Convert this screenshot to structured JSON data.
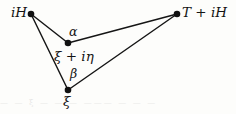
{
  "figure": {
    "name": "contour-triangle-diagram",
    "width": 236,
    "height": 114,
    "background_color": "#fdfdfb",
    "stroke_color": "#151515",
    "vertices": [
      {
        "id": "iH",
        "label": "iH",
        "x": 31,
        "y": 14,
        "label_x": 11,
        "label_y": 6
      },
      {
        "id": "TiH",
        "label": "T + iH",
        "x": 177,
        "y": 14,
        "label_x": 182,
        "label_y": 6
      },
      {
        "id": "xi_ieta",
        "label": "ξ + iη",
        "x": 68,
        "y": 43,
        "label_x": 54,
        "label_y": 50
      },
      {
        "id": "xi",
        "label": "ξ",
        "x": 68,
        "y": 90,
        "label_x": 63,
        "label_y": 95
      }
    ],
    "edges": [
      {
        "id": "edge-ih-to-xi-ieta",
        "from": "iH",
        "to": "xi_ieta"
      },
      {
        "id": "edge-ih-to-xi",
        "from": "iH",
        "to": "xi"
      },
      {
        "id": "edge-xi-ieta-to-tih",
        "from": "xi_ieta",
        "to": "TiH"
      },
      {
        "id": "edge-xi-to-tih",
        "from": "xi",
        "to": "TiH"
      }
    ],
    "angles": [
      {
        "id": "alpha",
        "label": "α",
        "at_vertex": "xi_ieta",
        "label_x": 69,
        "label_y": 26
      },
      {
        "id": "beta",
        "label": "β",
        "at_vertex": "xi",
        "label_x": 70,
        "label_y": 68
      }
    ],
    "bleed_through_text": "—  —    ξ    —  — —  ———  — —     —"
  }
}
